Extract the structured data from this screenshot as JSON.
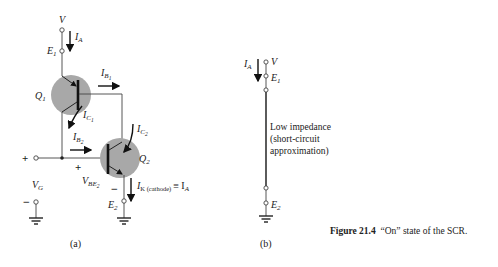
{
  "figure": {
    "number_label": "Figure 21.4",
    "title_text": "“On” state of the SCR."
  },
  "panel_a": {
    "label": "(a)",
    "supply_label": "V",
    "anode_current": "I",
    "anode_current_sub": "A",
    "e1": "E",
    "e1_sub": "1",
    "q1": "Q",
    "q1_sub": "1",
    "q2": "Q",
    "q2_sub": "2",
    "ib1": "I",
    "ib1_sub": "B",
    "ib1_subsub": "1",
    "ic1": "I",
    "ic1_sub": "C",
    "ic1_subsub": "1",
    "ib2": "I",
    "ib2_sub": "B",
    "ib2_subsub": "2",
    "ic2": "I",
    "ic2_sub": "C",
    "ic2_subsub": "2",
    "plus": "+",
    "minus": "−",
    "vg": "V",
    "vg_sub": "G",
    "vbe2": "V",
    "vbe2_sub": "BE",
    "vbe2_subsub": "2",
    "ik": "I",
    "ik_sub": "K (cathode)",
    "ik_equiv": "≡ I",
    "ik_equiv_sub": "A",
    "e2": "E",
    "e2_sub": "2"
  },
  "panel_b": {
    "label": "(b)",
    "anode_current": "I",
    "anode_current_sub": "A",
    "supply_label": "V",
    "e1": "E",
    "e1_sub": "1",
    "e2": "E",
    "e2_sub": "2",
    "note_lines": [
      "Low impedance",
      "(short-circuit",
      "approximation)"
    ]
  },
  "colors": {
    "wire": "#444444",
    "transistor_fill": "#a8a8a8",
    "text": "#1a1a1a"
  }
}
